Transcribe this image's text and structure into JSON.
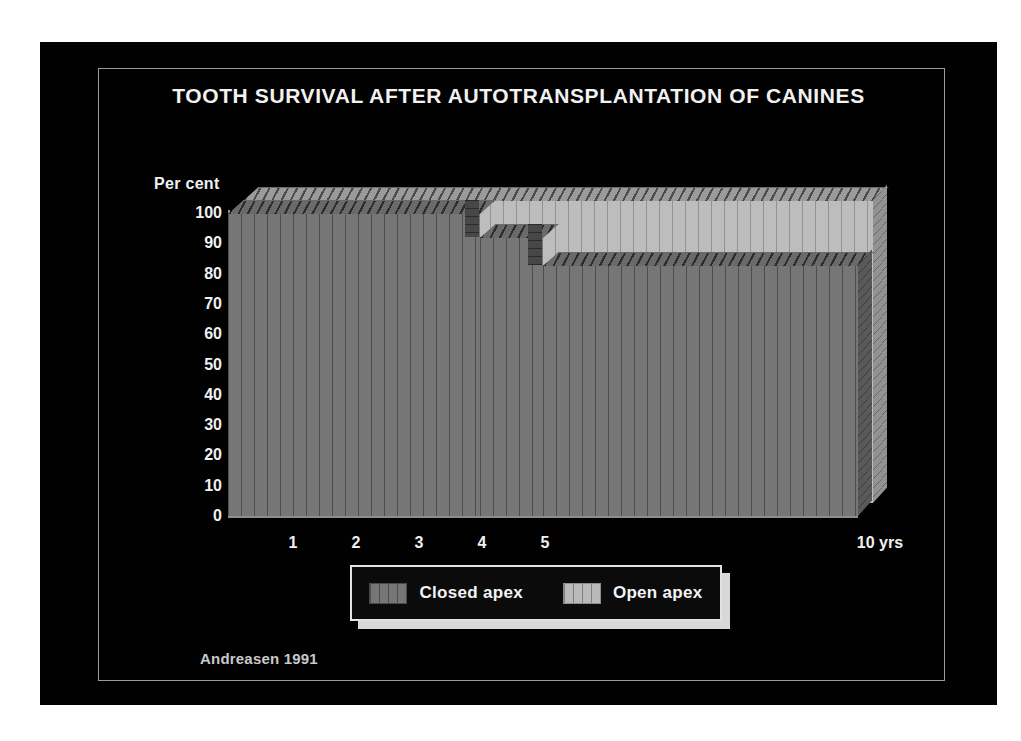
{
  "slide": {
    "title": "TOOTH SURVIVAL AFTER AUTOTRANSPLANTATION OF CANINES",
    "source_credit": "Andreasen 1991",
    "background_color": "#010101",
    "frame_color": "#9a9a9a",
    "text_color": "#f0f0f0"
  },
  "legend": {
    "entries": [
      {
        "label": "Closed apex",
        "color": "#6f6f6f",
        "swatch": "closed-apex-swatch"
      },
      {
        "label": "Open apex",
        "color": "#b6b6b6",
        "swatch": "open-apex-swatch"
      }
    ]
  },
  "chart_data": {
    "type": "area",
    "title": "TOOTH SURVIVAL AFTER AUTOTRANSPLANTATION OF CANINES",
    "subtitle": "",
    "xlabel": "",
    "ylabel": "Per cent",
    "x_unit_label": "10 yrs",
    "xlim": [
      0,
      10
    ],
    "ylim": [
      0,
      100
    ],
    "grid": false,
    "legend_position": "below-plot",
    "y_ticks": [
      100,
      90,
      80,
      70,
      60,
      50,
      40,
      30,
      20,
      10,
      0
    ],
    "x_ticks": [
      1,
      2,
      3,
      4,
      5
    ],
    "x_tick_labels": [
      "1",
      "2",
      "3",
      "4",
      "5"
    ],
    "x_right_label": "10 yrs",
    "x": [
      0,
      1,
      2,
      3,
      4,
      5,
      6,
      7,
      8,
      9,
      10
    ],
    "series": [
      {
        "name": "Closed apex",
        "color": "#6f6f6f",
        "step": true,
        "values": [
          100,
          100,
          100,
          100,
          92,
          83,
          83,
          83,
          83,
          83,
          83
        ]
      },
      {
        "name": "Open apex",
        "color": "#b6b6b6",
        "step": true,
        "values": [
          100,
          100,
          100,
          100,
          100,
          100,
          100,
          100,
          100,
          100,
          100
        ]
      }
    ]
  }
}
